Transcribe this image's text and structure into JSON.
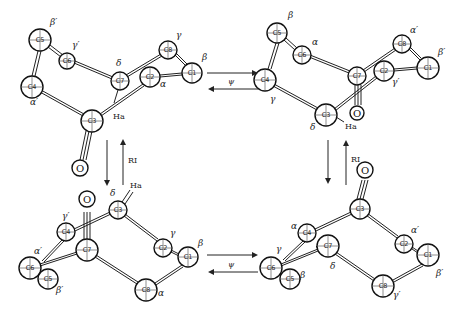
{
  "figure": {
    "arrows": {
      "psi_label": "ψ",
      "ri_label": "RI"
    },
    "hydrogen_label": "Ha",
    "oxygen_label": "O",
    "structures": [
      {
        "position": "top-left",
        "atoms": [
          {
            "id": "C5",
            "x": 40,
            "y": 40,
            "r": 11,
            "greek": "β′",
            "gx": 50,
            "gy": 25
          },
          {
            "id": "C6",
            "x": 67,
            "y": 61,
            "r": 8,
            "greek": "γ′",
            "gx": 72,
            "gy": 48
          },
          {
            "id": "C4",
            "x": 32,
            "y": 87,
            "r": 11,
            "greek": "α′",
            "gx": 30,
            "gy": 105
          },
          {
            "id": "C7",
            "x": 120,
            "y": 81,
            "r": 9,
            "greek": "δ",
            "gx": 116,
            "gy": 66
          },
          {
            "id": "C2",
            "x": 150,
            "y": 77,
            "r": 10,
            "greek": "α",
            "gx": 160,
            "gy": 87
          },
          {
            "id": "C8",
            "x": 168,
            "y": 50,
            "r": 9,
            "greek": "γ",
            "gx": 176,
            "gy": 38
          },
          {
            "id": "C1",
            "x": 192,
            "y": 73,
            "r": 10,
            "greek": "β",
            "gx": 202,
            "gy": 60
          },
          {
            "id": "C3",
            "x": 92,
            "y": 121,
            "r": 11,
            "greek": "",
            "gx": 0,
            "gy": 0
          }
        ]
      },
      {
        "position": "top-right",
        "atoms": [
          {
            "id": "C5",
            "x": 277,
            "y": 33,
            "r": 10,
            "greek": "β",
            "gx": 288,
            "gy": 18
          },
          {
            "id": "C6",
            "x": 302,
            "y": 55,
            "r": 9,
            "greek": "α",
            "gx": 312,
            "gy": 45
          },
          {
            "id": "C4",
            "x": 265,
            "y": 80,
            "r": 11,
            "greek": "γ",
            "gx": 270,
            "gy": 102
          },
          {
            "id": "C7",
            "x": 357,
            "y": 76,
            "r": 9,
            "greek": "",
            "gx": 0,
            "gy": 0
          },
          {
            "id": "C2",
            "x": 384,
            "y": 71,
            "r": 10,
            "greek": "γ′",
            "gx": 392,
            "gy": 85
          },
          {
            "id": "C8",
            "x": 402,
            "y": 44,
            "r": 9,
            "greek": "α′",
            "gx": 410,
            "gy": 33
          },
          {
            "id": "C1",
            "x": 428,
            "y": 68,
            "r": 11,
            "greek": "β′",
            "gx": 438,
            "gy": 55
          },
          {
            "id": "C3",
            "x": 326,
            "y": 115,
            "r": 11,
            "greek": "δ",
            "gx": 310,
            "gy": 130
          }
        ]
      },
      {
        "position": "bottom-left",
        "atoms": [
          {
            "id": "C3",
            "x": 118,
            "y": 210,
            "r": 9,
            "greek": "δ",
            "gx": 110,
            "gy": 196
          },
          {
            "id": "C4",
            "x": 66,
            "y": 232,
            "r": 9,
            "greek": "γ′",
            "gx": 62,
            "gy": 219
          },
          {
            "id": "C7",
            "x": 87,
            "y": 250,
            "r": 11,
            "greek": "",
            "gx": 0,
            "gy": 0
          },
          {
            "id": "C6",
            "x": 30,
            "y": 268,
            "r": 11,
            "greek": "α′",
            "gx": 34,
            "gy": 254
          },
          {
            "id": "C5",
            "x": 48,
            "y": 279,
            "r": 10,
            "greek": "β′",
            "gx": 56,
            "gy": 293
          },
          {
            "id": "C2",
            "x": 163,
            "y": 248,
            "r": 9,
            "greek": "γ",
            "gx": 170,
            "gy": 236
          },
          {
            "id": "C1",
            "x": 188,
            "y": 257,
            "r": 10,
            "greek": "β",
            "gx": 198,
            "gy": 246
          },
          {
            "id": "C8",
            "x": 146,
            "y": 290,
            "r": 11,
            "greek": "α",
            "gx": 158,
            "gy": 296
          }
        ]
      },
      {
        "position": "bottom-right",
        "atoms": [
          {
            "id": "C3",
            "x": 360,
            "y": 209,
            "r": 10,
            "greek": "",
            "gx": 0,
            "gy": 0
          },
          {
            "id": "C4",
            "x": 307,
            "y": 233,
            "r": 9,
            "greek": "α",
            "gx": 291,
            "gy": 229
          },
          {
            "id": "C7",
            "x": 328,
            "y": 246,
            "r": 11,
            "greek": "δ",
            "gx": 330,
            "gy": 269
          },
          {
            "id": "C6",
            "x": 271,
            "y": 268,
            "r": 11,
            "greek": "γ",
            "gx": 276,
            "gy": 252
          },
          {
            "id": "C5",
            "x": 290,
            "y": 279,
            "r": 10,
            "greek": "β",
            "gx": 300,
            "gy": 278
          },
          {
            "id": "C2",
            "x": 404,
            "y": 244,
            "r": 9,
            "greek": "α′",
            "gx": 411,
            "gy": 233
          },
          {
            "id": "C1",
            "x": 428,
            "y": 255,
            "r": 11,
            "greek": "β′",
            "gx": 436,
            "gy": 276
          },
          {
            "id": "C8",
            "x": 383,
            "y": 286,
            "r": 11,
            "greek": "γ′",
            "gx": 393,
            "gy": 298
          }
        ]
      }
    ]
  }
}
